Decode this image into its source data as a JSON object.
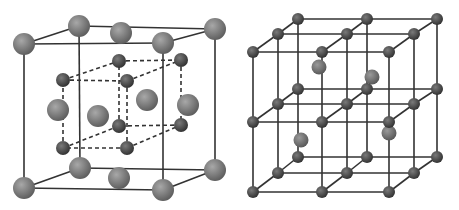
{
  "figure": {
    "title": "",
    "width": 459,
    "height": 210,
    "colors": {
      "background": "#ffffff",
      "line": "#333333",
      "large_atom_light": "#a8a8a8",
      "large_atom_dark": "#5a5a5a",
      "small_atom_light": "#7a7a7a",
      "small_atom_dark": "#2e2e2e",
      "interstitial_light": "#9a9a9a",
      "interstitial_dark": "#555555"
    }
  },
  "left_lattice": {
    "name": "face-centered cubic with inner dashed cube",
    "outer_cube": {
      "corners": {
        "ftl": [
          24,
          44
        ],
        "ftr": [
          163,
          43
        ],
        "fbl": [
          24,
          188
        ],
        "fbr": [
          163,
          190
        ],
        "btl": [
          79,
          26
        ],
        "btr": [
          215,
          29
        ],
        "bbl": [
          80,
          168
        ],
        "bbr": [
          215,
          170
        ]
      }
    },
    "inner_cube": {
      "corners": {
        "ftl": [
          63,
          80
        ],
        "ftr": [
          127,
          81
        ],
        "fbl": [
          63,
          148
        ],
        "fbr": [
          127,
          148
        ],
        "btl": [
          119,
          61
        ],
        "btr": [
          181,
          60
        ],
        "bbl": [
          119,
          126
        ],
        "bbr": [
          181,
          125
        ]
      }
    },
    "large_atoms": [
      {
        "x": 79,
        "y": 26,
        "r": 11
      },
      {
        "x": 121,
        "y": 33,
        "r": 11
      },
      {
        "x": 215,
        "y": 29,
        "r": 11
      },
      {
        "x": 24,
        "y": 44,
        "r": 11
      },
      {
        "x": 163,
        "y": 43,
        "r": 11
      },
      {
        "x": 58,
        "y": 110,
        "r": 11
      },
      {
        "x": 98,
        "y": 116,
        "r": 11
      },
      {
        "x": 147,
        "y": 100,
        "r": 11
      },
      {
        "x": 188,
        "y": 105,
        "r": 11
      },
      {
        "x": 80,
        "y": 168,
        "r": 11
      },
      {
        "x": 215,
        "y": 170,
        "r": 11
      },
      {
        "x": 119,
        "y": 178,
        "r": 11
      },
      {
        "x": 24,
        "y": 188,
        "r": 11
      },
      {
        "x": 163,
        "y": 190,
        "r": 11
      }
    ],
    "small_atoms": [
      {
        "x": 119,
        "y": 61,
        "r": 7
      },
      {
        "x": 181,
        "y": 60,
        "r": 7
      },
      {
        "x": 63,
        "y": 80,
        "r": 7
      },
      {
        "x": 127,
        "y": 81,
        "r": 7
      },
      {
        "x": 119,
        "y": 126,
        "r": 7
      },
      {
        "x": 181,
        "y": 125,
        "r": 7
      },
      {
        "x": 63,
        "y": 148,
        "r": 7
      },
      {
        "x": 127,
        "y": 148,
        "r": 7
      }
    ]
  },
  "right_lattice": {
    "name": "3x3x3 simple cubic grid with interstitial atoms",
    "layers": [
      {
        "xs": [
          298,
          367,
          437
        ],
        "ys": [
          19,
          89,
          157
        ]
      },
      {
        "xs": [
          278,
          347,
          414
        ],
        "ys": [
          34,
          104,
          173
        ]
      },
      {
        "xs": [
          253,
          322,
          389
        ],
        "ys": [
          52,
          122,
          192
        ]
      }
    ],
    "node_radius": 6,
    "interstitial_atoms": [
      {
        "x": 319,
        "y": 67,
        "r": 7.5
      },
      {
        "x": 372,
        "y": 77,
        "r": 7.5
      },
      {
        "x": 301,
        "y": 140,
        "r": 7.5
      },
      {
        "x": 389,
        "y": 133,
        "r": 7.5
      }
    ]
  }
}
